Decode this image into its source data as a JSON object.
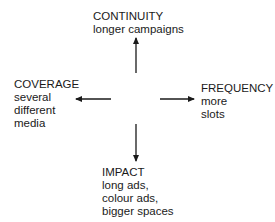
{
  "diagram": {
    "nodes": {
      "top": {
        "title": "CONTINUITY",
        "lines": [
          "longer campaigns"
        ]
      },
      "left": {
        "title": "COVERAGE",
        "lines": [
          "several",
          "different",
          "media"
        ]
      },
      "right": {
        "title": "FREQUENCY",
        "lines": [
          "more",
          "slots"
        ]
      },
      "bottom": {
        "title": "IMPACT",
        "lines": [
          "long ads,",
          "colour ads,",
          "bigger spaces"
        ]
      }
    },
    "arrows": [
      "up",
      "left",
      "right",
      "down"
    ],
    "colors": {
      "ink": "#1a1a1a",
      "background": "#ffffff"
    }
  }
}
